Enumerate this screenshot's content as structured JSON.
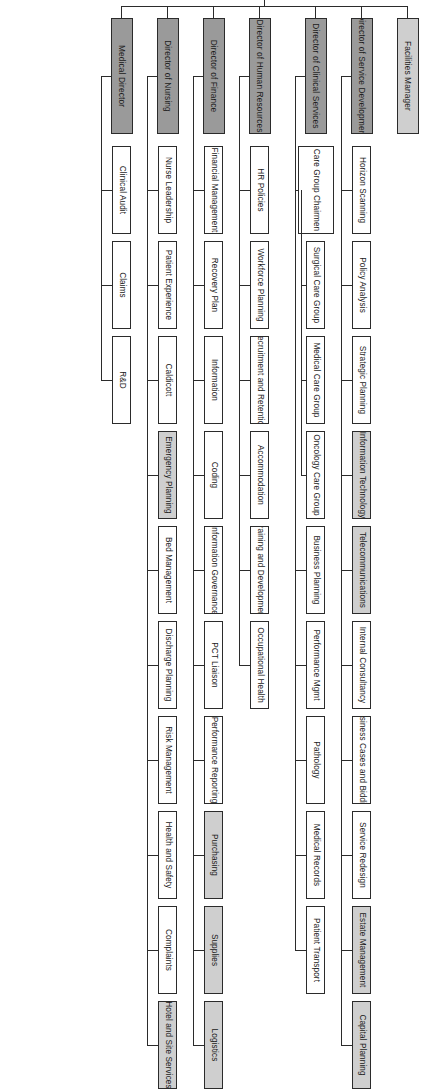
{
  "chart_meta": {
    "type": "org-chart",
    "orientation": "rotated-90-vertical-text",
    "title": "",
    "legend": {
      "dark_fill": "#9a9a9a",
      "shaded_fill": "#cfcfcf",
      "plain_fill": "#ffffff",
      "line_color": "#2b2b2b"
    }
  },
  "top_level": [
    {
      "id": "communications",
      "label": "Communications",
      "fill": "plain"
    },
    {
      "id": "fundraising",
      "label": "Fundraising",
      "fill": "plain"
    }
  ],
  "directors": [
    {
      "id": "medical-director",
      "label": "Medical Director",
      "fill": "dark",
      "children": [
        {
          "label": "Clinical Audit",
          "fill": "plain"
        },
        {
          "label": "Claims",
          "fill": "plain"
        },
        {
          "label": "R&D",
          "fill": "plain"
        }
      ]
    },
    {
      "id": "director-of-nursing",
      "label": "Director of Nursing",
      "fill": "dark",
      "children": [
        {
          "label": "Nurse Leadership",
          "fill": "plain"
        },
        {
          "label": "Patient Experience",
          "fill": "plain"
        },
        {
          "label": "Caldicott",
          "fill": "plain"
        },
        {
          "label": "Emergency Planning",
          "fill": "shade"
        },
        {
          "label": "Bed Management",
          "fill": "plain"
        },
        {
          "label": "Discharge Planning",
          "fill": "plain"
        },
        {
          "label": "Risk Management",
          "fill": "plain"
        },
        {
          "label": "Health and Safety",
          "fill": "plain"
        },
        {
          "label": "Complaints",
          "fill": "plain"
        },
        {
          "label": "Hotel and Site Services",
          "fill": "shade"
        }
      ]
    },
    {
      "id": "director-of-finance",
      "label": "Director of Finance",
      "fill": "dark",
      "children": [
        {
          "label": "Financial Management",
          "fill": "plain"
        },
        {
          "label": "Recovery Plan",
          "fill": "plain"
        },
        {
          "label": "Information",
          "fill": "plain"
        },
        {
          "label": "Coding",
          "fill": "plain"
        },
        {
          "label": "Information Governance",
          "fill": "plain"
        },
        {
          "label": "PCT Liaison",
          "fill": "plain"
        },
        {
          "label": "Performance Reporting",
          "fill": "plain"
        },
        {
          "label": "Purchasing",
          "fill": "shade"
        },
        {
          "label": "Supplies",
          "fill": "shade"
        },
        {
          "label": "Logistics",
          "fill": "shade"
        }
      ]
    },
    {
      "id": "director-of-human-resources",
      "label": "Director of Human Resources",
      "fill": "dark",
      "children": [
        {
          "label": "HR Policies",
          "fill": "plain"
        },
        {
          "label": "Workforce Planning",
          "fill": "plain"
        },
        {
          "label": "Recruitment and Retention",
          "fill": "plain"
        },
        {
          "label": "Accommodation",
          "fill": "plain"
        },
        {
          "label": "Training and Development",
          "fill": "plain"
        },
        {
          "label": "Occupational Health",
          "fill": "plain"
        }
      ]
    },
    {
      "id": "director-of-clinical-services",
      "label": "Director of Clinical Services",
      "fill": "dark",
      "children": [
        {
          "label": "Care Group Chairmen",
          "fill": "plain",
          "children": [
            {
              "label": "Surgical Care Group",
              "fill": "plain"
            },
            {
              "label": "Medical Care Group",
              "fill": "plain"
            },
            {
              "label": "Oncology Care Group",
              "fill": "plain"
            }
          ]
        },
        {
          "label": "Business Planning",
          "fill": "plain"
        },
        {
          "label": "Performance Mgmt",
          "fill": "plain"
        },
        {
          "label": "Pathology",
          "fill": "plain"
        },
        {
          "label": "Medical Records",
          "fill": "plain"
        },
        {
          "label": "Patient Transport",
          "fill": "plain"
        }
      ]
    },
    {
      "id": "director-of-service-development",
      "label": "Director of Service Development",
      "fill": "dark",
      "children": [
        {
          "label": "Horizon Scanning",
          "fill": "plain"
        },
        {
          "label": "Policy Analysis",
          "fill": "plain"
        },
        {
          "label": "Strategic Planning",
          "fill": "plain"
        },
        {
          "label": "Information Technology",
          "fill": "shade"
        },
        {
          "label": "Telecommunications",
          "fill": "shade"
        },
        {
          "label": "Internal Consultancy",
          "fill": "plain"
        },
        {
          "label": "Business Cases and Bidding",
          "fill": "plain"
        },
        {
          "label": "Service Redesign",
          "fill": "plain"
        },
        {
          "label": "Estate Management",
          "fill": "shade"
        },
        {
          "label": "Capital Planning",
          "fill": "shade"
        }
      ]
    },
    {
      "id": "facilities-manager",
      "label": "Facilities Manager",
      "fill": "shade",
      "children": []
    }
  ]
}
